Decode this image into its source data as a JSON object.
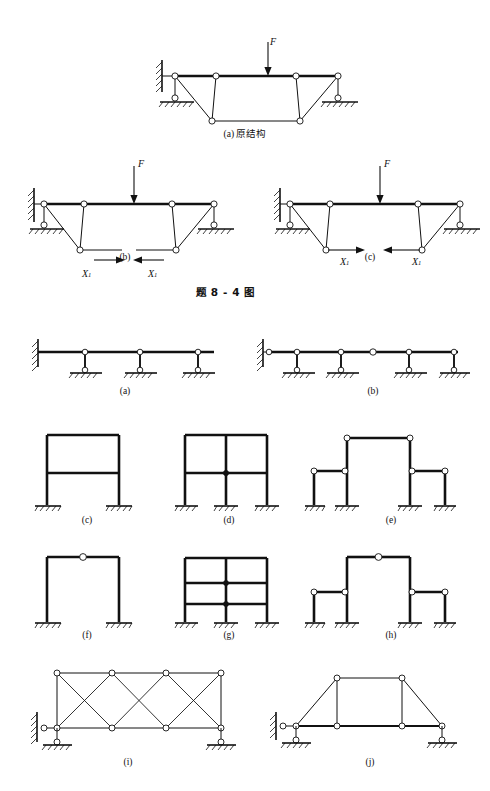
{
  "page": {
    "width": 490,
    "height": 791,
    "background": "#ffffff",
    "ink": "#111111"
  },
  "figure_8_4": {
    "caption": "题 8 - 4 图",
    "caption_x": 196,
    "caption_y": 288,
    "panels": [
      {
        "key": "a",
        "label": "(a) 原结构",
        "label_x": 245,
        "label_y": 131,
        "origin_x": 150,
        "origin_y": 40,
        "force_label": "F",
        "force_sub": "",
        "x1_labels": []
      },
      {
        "key": "b",
        "label": "(b)",
        "label_x": 124,
        "label_y": 258,
        "origin_x": 22,
        "origin_y": 160,
        "force_label": "F",
        "force_sub": "",
        "x1_labels": [
          "X",
          "X"
        ],
        "x1_sub": "1",
        "cut_direction": "inward"
      },
      {
        "key": "c",
        "label": "(c)",
        "label_x": 368,
        "label_y": 258,
        "origin_x": 268,
        "origin_y": 160,
        "force_label": "F",
        "force_sub": "",
        "x1_labels": [
          "X",
          "X"
        ],
        "x1_sub": "1",
        "cut_direction": "outward"
      }
    ]
  },
  "figure_bottom": {
    "panels": [
      {
        "key": "a",
        "label": "(a)",
        "label_x": 123,
        "label_y": 392,
        "type": "continuous-beam",
        "description": "cantilever wall support with three roller supports"
      },
      {
        "key": "b",
        "label": "(b)",
        "label_x": 372,
        "label_y": 392,
        "type": "continuous-beam-hinged",
        "description": "wall hinge, four roller supports, mid-span hinge"
      },
      {
        "key": "c",
        "label": "(c)",
        "label_x": 86,
        "label_y": 521,
        "type": "frame",
        "description": "two-storey single-bay rigid frame, two fixed bases"
      },
      {
        "key": "d",
        "label": "(d)",
        "label_x": 228,
        "label_y": 521,
        "type": "frame",
        "description": "two-storey two-bay rigid frame, three fixed bases"
      },
      {
        "key": "e",
        "label": "(e)",
        "label_x": 390,
        "label_y": 521,
        "type": "frame-hinged",
        "description": "tall central portal with hinges and two low side frames"
      },
      {
        "key": "f",
        "label": "(f)",
        "label_x": 86,
        "label_y": 636,
        "type": "frame-three-hinged",
        "description": "portal frame with crown hinge, two fixed bases"
      },
      {
        "key": "g",
        "label": "(g)",
        "label_x": 228,
        "label_y": 636,
        "type": "frame",
        "description": "three-storey two-bay rigid frame, three fixed bases"
      },
      {
        "key": "h",
        "label": "(h)",
        "label_x": 390,
        "label_y": 636,
        "type": "frame-hinged",
        "description": "tall central portal with crown hinge and two low side frames"
      },
      {
        "key": "i",
        "label": "(i)",
        "label_x": 126,
        "label_y": 763,
        "type": "truss",
        "description": "three-panel rectangular truss with cross bracing"
      },
      {
        "key": "j",
        "label": "(j)",
        "label_x": 368,
        "label_y": 763,
        "type": "truss",
        "description": "trapezoidal truss with two vertical web members"
      }
    ]
  },
  "geometry": {
    "fig_a": {
      "top_left_x": 25,
      "top_right_x": 188,
      "top_y": 36,
      "node_top": [
        25,
        66,
        122,
        188
      ],
      "bottom_y": 81,
      "node_bottom": [
        62,
        150
      ],
      "force_x": 118,
      "force_top_y": 2,
      "force_bottom_y": 33
    },
    "fig_bc": {
      "top_left_x": 22,
      "top_right_x": 192,
      "top_y": 44,
      "node_top": [
        22,
        62,
        130,
        192
      ],
      "bottom_y": 90,
      "node_bottom": [
        58,
        154
      ],
      "force_x": 112,
      "force_top_y": 6,
      "force_bottom_y": 41
    },
    "beam_a": {
      "x0": 36,
      "x1": 214,
      "y": 352,
      "supports": [
        85,
        140,
        198
      ]
    },
    "beam_b": {
      "x0": 262,
      "x1": 458,
      "y": 352,
      "supports": [
        298,
        340,
        408,
        452
      ],
      "hinges": [
        298,
        372
      ]
    },
    "truss_i": {
      "left": 55,
      "right": 225,
      "top": 672,
      "bottom": 730,
      "panels": 3
    },
    "truss_j": {
      "left": 290,
      "right": 455,
      "top": 678,
      "bottom": 728
    }
  }
}
